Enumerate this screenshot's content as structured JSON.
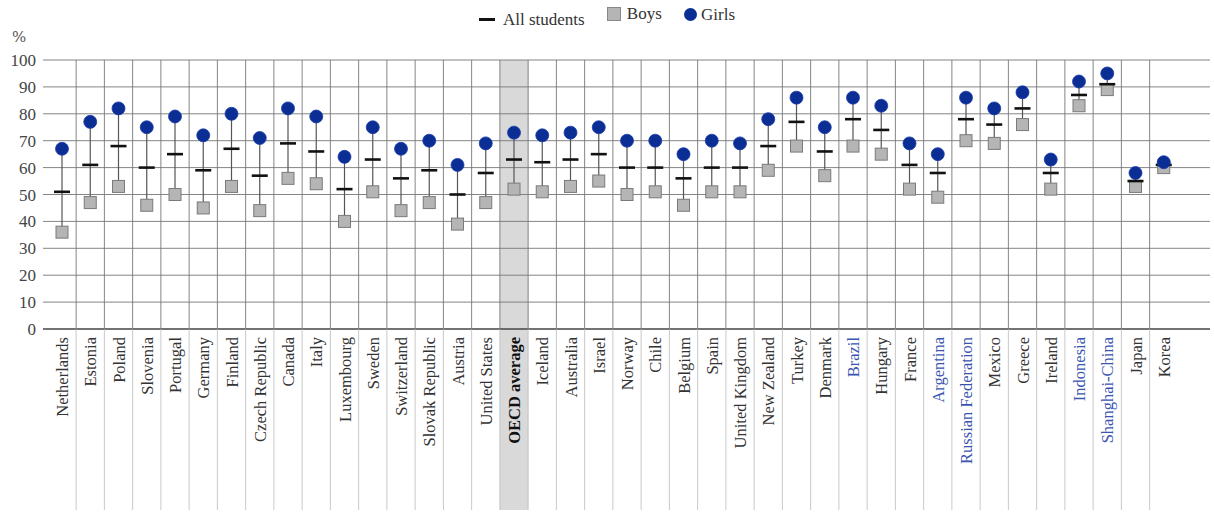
{
  "legend": {
    "all_students": "All students",
    "boys": "Boys",
    "girls": "Girls"
  },
  "axis": {
    "y_unit": "%",
    "y_ticks": [
      "0",
      "10",
      "20",
      "30",
      "40",
      "50",
      "60",
      "70",
      "80",
      "90",
      "100"
    ]
  },
  "colors": {
    "girls": "#0b2e94",
    "boys": "#b5b5b5",
    "mean": "#111111",
    "highlight": "#d9d9d9",
    "partner_label": "#3a55b0",
    "label": "#333333"
  },
  "chart_data": {
    "type": "dot-range",
    "title": "",
    "xlabel": "",
    "ylabel": "%",
    "ylim": [
      0,
      100
    ],
    "grid": true,
    "legend_position": "top",
    "categories": [
      "Netherlands",
      "Estonia",
      "Poland",
      "Slovenia",
      "Portugal",
      "Germany",
      "Finland",
      "Czech Republic",
      "Canada",
      "Italy",
      "Luxembourg",
      "Sweden",
      "Switzerland",
      "Slovak Republic",
      "Austria",
      "United States",
      "OECD average",
      "Iceland",
      "Australia",
      "Israel",
      "Norway",
      "Chile",
      "Belgium",
      "Spain",
      "United Kingdom",
      "New Zealand",
      "Turkey",
      "Denmark",
      "Brazil",
      "Hungary",
      "France",
      "Argentina",
      "Russian Federation",
      "Mexico",
      "Greece",
      "Ireland",
      "Indonesia",
      "Shanghai-China",
      "Japan",
      "Korea"
    ],
    "partner_countries": [
      "Brazil",
      "Argentina",
      "Russian Federation",
      "Indonesia",
      "Shanghai-China"
    ],
    "highlighted": "OECD average",
    "series": [
      {
        "name": "All students",
        "marker": "dash",
        "values": [
          51,
          61,
          68,
          60,
          65,
          59,
          67,
          57,
          69,
          66,
          52,
          63,
          56,
          59,
          50,
          58,
          63,
          62,
          63,
          65,
          60,
          60,
          56,
          60,
          60,
          68,
          77,
          66,
          78,
          74,
          61,
          58,
          78,
          76,
          82,
          58,
          87,
          91,
          55,
          61
        ]
      },
      {
        "name": "Boys",
        "marker": "square",
        "values": [
          36,
          47,
          53,
          46,
          50,
          45,
          53,
          44,
          56,
          54,
          40,
          51,
          44,
          47,
          39,
          47,
          52,
          51,
          53,
          55,
          50,
          51,
          46,
          51,
          51,
          59,
          68,
          57,
          68,
          65,
          52,
          49,
          70,
          69,
          76,
          52,
          83,
          89,
          53,
          60
        ]
      },
      {
        "name": "Girls",
        "marker": "circle",
        "values": [
          67,
          77,
          82,
          75,
          79,
          72,
          80,
          71,
          82,
          79,
          64,
          75,
          67,
          70,
          61,
          69,
          73,
          72,
          73,
          75,
          70,
          70,
          65,
          70,
          69,
          78,
          86,
          75,
          86,
          83,
          69,
          65,
          86,
          82,
          88,
          63,
          92,
          95,
          58,
          62
        ]
      }
    ]
  }
}
